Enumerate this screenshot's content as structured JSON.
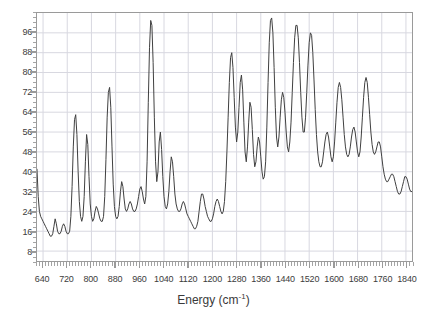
{
  "chart_data": {
    "type": "line",
    "title": "",
    "xlabel": "Energy (cm-1)",
    "xlabel_base": "Energy (cm",
    "xlabel_sup": "-1",
    "xlabel_tail": ")",
    "ylabel": "",
    "xlim": [
      620,
      1860
    ],
    "ylim": [
      4,
      104
    ],
    "grid": true,
    "legend": "none",
    "line_color": "#404040",
    "grid_color": "#d8d8e0",
    "axis_color": "#9a9a9a",
    "xticks": [
      640,
      720,
      800,
      880,
      960,
      1040,
      1120,
      1200,
      1280,
      1360,
      1440,
      1520,
      1600,
      1680,
      1760,
      1840
    ],
    "yticks": [
      8,
      16,
      24,
      32,
      40,
      48,
      56,
      64,
      72,
      80,
      88,
      96
    ],
    "x": [
      620,
      624,
      628,
      632,
      636,
      640,
      644,
      648,
      652,
      656,
      660,
      664,
      668,
      672,
      676,
      680,
      684,
      688,
      692,
      696,
      700,
      704,
      708,
      712,
      716,
      720,
      724,
      728,
      732,
      736,
      740,
      744,
      748,
      752,
      756,
      760,
      764,
      768,
      772,
      776,
      780,
      784,
      788,
      792,
      796,
      800,
      804,
      808,
      812,
      816,
      820,
      824,
      828,
      832,
      836,
      840,
      844,
      848,
      852,
      856,
      860,
      864,
      868,
      872,
      876,
      880,
      884,
      888,
      892,
      896,
      900,
      904,
      908,
      912,
      916,
      920,
      924,
      928,
      932,
      936,
      940,
      944,
      948,
      952,
      956,
      960,
      964,
      968,
      972,
      976,
      980,
      984,
      988,
      992,
      996,
      1000,
      1004,
      1008,
      1012,
      1016,
      1020,
      1024,
      1028,
      1032,
      1036,
      1040,
      1044,
      1048,
      1052,
      1056,
      1060,
      1064,
      1068,
      1072,
      1076,
      1080,
      1084,
      1088,
      1092,
      1096,
      1100,
      1104,
      1108,
      1112,
      1116,
      1120,
      1124,
      1128,
      1132,
      1136,
      1140,
      1144,
      1148,
      1152,
      1156,
      1160,
      1164,
      1168,
      1172,
      1176,
      1180,
      1184,
      1188,
      1192,
      1196,
      1200,
      1204,
      1208,
      1212,
      1216,
      1220,
      1224,
      1228,
      1232,
      1236,
      1240,
      1244,
      1248,
      1252,
      1256,
      1260,
      1264,
      1268,
      1272,
      1276,
      1280,
      1284,
      1288,
      1292,
      1296,
      1300,
      1304,
      1308,
      1312,
      1316,
      1320,
      1324,
      1328,
      1332,
      1336,
      1340,
      1344,
      1348,
      1352,
      1356,
      1360,
      1364,
      1368,
      1372,
      1376,
      1380,
      1384,
      1388,
      1392,
      1396,
      1400,
      1404,
      1408,
      1412,
      1416,
      1420,
      1424,
      1428,
      1432,
      1436,
      1440,
      1444,
      1448,
      1452,
      1456,
      1460,
      1464,
      1468,
      1472,
      1476,
      1480,
      1484,
      1488,
      1492,
      1496,
      1500,
      1504,
      1508,
      1512,
      1516,
      1520,
      1524,
      1528,
      1532,
      1536,
      1540,
      1544,
      1548,
      1552,
      1556,
      1560,
      1564,
      1568,
      1572,
      1576,
      1580,
      1584,
      1588,
      1592,
      1596,
      1600,
      1604,
      1608,
      1612,
      1616,
      1620,
      1624,
      1628,
      1632,
      1636,
      1640,
      1644,
      1648,
      1652,
      1656,
      1660,
      1664,
      1668,
      1672,
      1676,
      1680,
      1684,
      1688,
      1692,
      1696,
      1700,
      1704,
      1708,
      1712,
      1716,
      1720,
      1724,
      1728,
      1732,
      1736,
      1740,
      1744,
      1748,
      1752,
      1756,
      1760,
      1764,
      1768,
      1772,
      1776,
      1780,
      1784,
      1788,
      1792,
      1796,
      1800,
      1804,
      1808,
      1812,
      1816,
      1820,
      1824,
      1828,
      1832,
      1836,
      1840,
      1844,
      1848,
      1852,
      1856,
      1860
    ],
    "y": [
      41,
      30,
      24,
      22,
      21,
      20,
      19,
      18,
      17,
      16,
      15,
      14,
      14,
      15,
      18,
      21,
      19,
      16,
      15,
      15,
      16,
      18,
      19,
      18,
      16,
      15,
      15,
      16,
      22,
      34,
      50,
      61,
      63,
      55,
      40,
      28,
      22,
      20,
      22,
      30,
      44,
      55,
      51,
      38,
      27,
      22,
      20,
      21,
      24,
      26,
      25,
      23,
      21,
      20,
      20,
      22,
      30,
      45,
      62,
      72,
      74,
      66,
      50,
      35,
      26,
      22,
      21,
      22,
      26,
      32,
      36,
      34,
      29,
      25,
      24,
      25,
      27,
      28,
      27,
      25,
      24,
      24,
      25,
      27,
      30,
      33,
      34,
      32,
      29,
      27,
      30,
      44,
      68,
      90,
      101,
      99,
      84,
      62,
      44,
      36,
      40,
      52,
      56,
      49,
      38,
      30,
      26,
      25,
      27,
      32,
      40,
      46,
      44,
      38,
      31,
      27,
      25,
      24,
      24,
      25,
      27,
      28,
      27,
      25,
      23,
      22,
      21,
      20,
      19,
      18,
      17,
      17,
      18,
      20,
      24,
      28,
      31,
      31,
      29,
      26,
      24,
      22,
      21,
      20,
      20,
      21,
      23,
      26,
      28,
      29,
      28,
      26,
      24,
      23,
      24,
      28,
      36,
      48,
      62,
      76,
      86,
      88,
      82,
      70,
      58,
      52,
      56,
      66,
      76,
      79,
      73,
      60,
      48,
      44,
      50,
      60,
      68,
      66,
      57,
      47,
      42,
      44,
      50,
      54,
      52,
      46,
      40,
      37,
      38,
      44,
      58,
      76,
      92,
      101,
      102,
      96,
      82,
      66,
      54,
      50,
      54,
      62,
      69,
      72,
      70,
      64,
      56,
      50,
      48,
      52,
      60,
      72,
      84,
      94,
      99,
      99,
      94,
      84,
      72,
      62,
      56,
      56,
      62,
      72,
      83,
      92,
      96,
      95,
      88,
      77,
      65,
      55,
      48,
      44,
      42,
      42,
      44,
      48,
      52,
      55,
      56,
      54,
      50,
      46,
      44,
      46,
      52,
      60,
      68,
      74,
      76,
      74,
      69,
      62,
      55,
      50,
      47,
      46,
      47,
      50,
      54,
      57,
      58,
      56,
      52,
      48,
      46,
      48,
      54,
      62,
      70,
      76,
      78,
      76,
      70,
      63,
      56,
      51,
      48,
      47,
      48,
      50,
      52,
      52,
      50,
      46,
      42,
      39,
      37,
      36,
      36,
      37,
      38,
      39,
      39,
      38,
      36,
      34,
      32,
      31,
      31,
      32,
      34,
      36,
      38,
      38,
      37,
      35,
      33,
      32,
      32,
      34,
      37,
      41,
      44,
      45,
      44,
      41,
      38,
      35,
      33,
      32,
      32,
      33,
      35,
      37,
      38,
      37,
      35,
      33,
      31,
      30,
      30,
      31,
      33,
      35,
      36,
      36,
      35,
      33,
      31,
      30,
      29,
      29,
      30,
      31,
      32,
      32,
      31,
      30,
      28,
      27,
      26,
      26,
      27,
      28,
      29,
      29,
      28,
      27,
      25,
      24,
      23,
      23,
      24,
      25,
      26,
      26,
      25,
      24,
      22,
      21,
      20,
      20,
      21,
      24,
      30,
      36,
      40,
      40,
      36,
      30,
      25,
      22,
      21,
      22,
      25,
      28,
      29,
      28,
      25,
      22,
      20,
      18,
      17,
      16,
      16,
      17,
      18,
      19,
      19,
      18,
      17,
      16,
      15,
      14,
      14,
      14,
      15,
      15,
      15,
      14,
      14,
      13,
      13,
      12,
      12,
      12,
      13,
      13,
      13,
      13,
      12,
      12,
      12,
      12,
      12,
      12,
      13,
      14,
      15,
      16,
      17,
      17,
      16,
      15,
      14,
      13,
      13,
      12,
      12,
      12,
      12,
      12,
      12,
      12,
      12,
      12,
      12,
      12,
      12,
      12,
      12,
      12,
      12,
      12,
      12,
      12,
      12,
      12,
      12,
      12,
      13,
      13,
      14,
      14,
      14,
      13,
      13,
      12,
      12,
      12,
      12,
      12,
      12,
      13,
      14,
      16,
      22,
      34,
      56,
      78,
      88,
      80,
      58,
      36,
      22,
      16,
      13,
      11,
      10,
      10,
      10,
      10,
      10,
      10,
      10,
      10,
      10,
      10,
      10,
      10,
      10,
      10,
      10,
      10,
      10,
      10,
      10,
      10,
      10
    ],
    "peaks": [
      {
        "energy": 740,
        "intensity": 63
      },
      {
        "energy": 780,
        "intensity": 55
      },
      {
        "energy": 860,
        "intensity": 74
      },
      {
        "energy": 996,
        "intensity": 101
      },
      {
        "energy": 1036,
        "intensity": 56
      },
      {
        "energy": 1180,
        "intensity": 88
      },
      {
        "energy": 1216,
        "intensity": 79
      },
      {
        "energy": 1296,
        "intensity": 102
      },
      {
        "energy": 1356,
        "intensity": 99
      },
      {
        "energy": 1392,
        "intensity": 96
      },
      {
        "energy": 1444,
        "intensity": 76
      },
      {
        "energy": 1496,
        "intensity": 78
      },
      {
        "energy": 1756,
        "intensity": 88
      }
    ]
  }
}
